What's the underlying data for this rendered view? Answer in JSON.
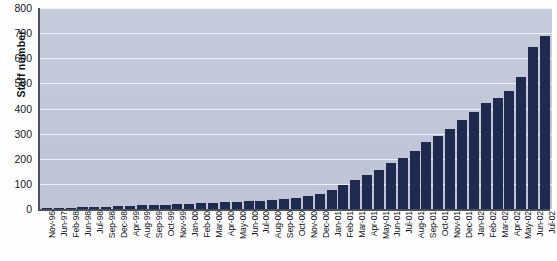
{
  "chart_data": {
    "type": "bar",
    "title": "",
    "xlabel": "",
    "ylabel": "Staff number",
    "ylim": [
      0,
      800
    ],
    "yticks": [
      0,
      100,
      200,
      300,
      400,
      500,
      600,
      700,
      800
    ],
    "grid": true,
    "legend": false,
    "bar_color": "#1e2a4e",
    "plot_background": "#c3c9da",
    "categories": [
      "Nov-96",
      "Jun-97",
      "Feb-98",
      "Jun-98",
      "Jul-98",
      "Sep-98",
      "Dec-98",
      "Apr-99",
      "Aug-99",
      "Sep-99",
      "Oct-99",
      "Nov-99",
      "Jan-00",
      "Feb-00",
      "Mar-00",
      "Apr-00",
      "May-00",
      "Jun-00",
      "Jul-00",
      "Aug-00",
      "Sep-00",
      "Oct-00",
      "Nov-00",
      "Dec-00",
      "Jan-01",
      "Feb-01",
      "Mar-01",
      "Apr-01",
      "May-01",
      "Jun-01",
      "Jul-01",
      "Aug-01",
      "Sep-01",
      "Oct-01",
      "Nov-01",
      "Dec-01",
      "Jan-02",
      "Feb-02",
      "Mar-02",
      "Apr-02",
      "May-02",
      "Jun-02",
      "Jul-02"
    ],
    "values": [
      2,
      4,
      6,
      8,
      9,
      10,
      12,
      13,
      14,
      15,
      16,
      18,
      20,
      22,
      24,
      26,
      28,
      30,
      33,
      36,
      40,
      45,
      52,
      60,
      75,
      95,
      115,
      135,
      155,
      185,
      205,
      230,
      265,
      290,
      320,
      355,
      385,
      420,
      440,
      470,
      525,
      645,
      690
    ]
  }
}
